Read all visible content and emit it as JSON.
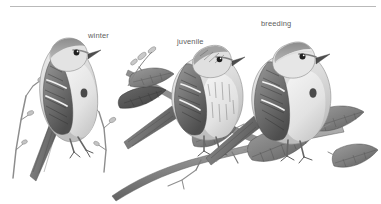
{
  "plate": {
    "kind": "field-guide-illustration",
    "subject": "sparrows",
    "style": "grayscale-halftone",
    "background_color": "#ffffff",
    "width": 381,
    "height": 204,
    "divider": {
      "present": true,
      "color": "#b9b9b9",
      "x": 10,
      "y": 6,
      "width": 366,
      "thickness": 1
    },
    "text_color": "#5e5e5e"
  },
  "labels": [
    {
      "id": "winter",
      "text": "winter",
      "x": 88,
      "y": 31
    },
    {
      "id": "juvenile",
      "text": "juvenile",
      "x": 177,
      "y": 37
    },
    {
      "id": "breeding",
      "text": "breeding",
      "x": 261,
      "y": 19
    }
  ],
  "figures": [
    {
      "id": "winter-bird",
      "label": "winter",
      "pose": "perched, facing right, upright on bare twig",
      "features": "plain pale breast with single dark central breast spot, streaked brown wings with two pale wing bars, grey face, rufous crown and eyeline, long notched tail angled down-left",
      "perch": "bare willow twig with buds / catkins"
    },
    {
      "id": "juvenile-bird",
      "label": "juvenile",
      "pose": "perched, facing right, behind and above the breeding bird",
      "features": "heavily streaked crown, breast and flanks, no breast spot, buff-brown plumage, dark streaked wings with pale wing bars",
      "perch": "leafy branch"
    },
    {
      "id": "breeding-bird",
      "label": "breeding",
      "pose": "perched, facing right, foreground rightmost",
      "features": "rufous cap, grey face with dark eyeline, unstreaked pale grey breast with dark central spot, rusty streaked back, two pale wing bars",
      "perch": "leafy branch with broad serrated leaves"
    }
  ],
  "foliage": {
    "branch_description": "diagonal woody branch running from lower-left to right across the lower half",
    "leaves": "broad elliptical serrated leaves with pinnate venation, dark grey-green shading",
    "twig": "thin bare twig with buds at far left supporting the winter bird"
  },
  "palette": {
    "ink_dark": "#3a3a3a",
    "ink_mid": "#777777",
    "ink_light": "#b5b5b5",
    "ink_pale": "#d8d8d8",
    "paper": "#ffffff",
    "rule": "#b9b9b9",
    "label": "#5e5e5e"
  }
}
